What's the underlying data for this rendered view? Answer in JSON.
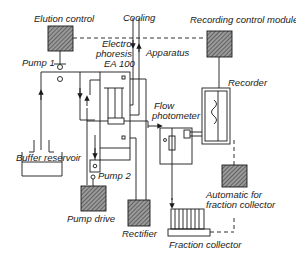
{
  "diagram": {
    "labels": {
      "elution_control": "Elution control",
      "cooling": "Cooling",
      "recording_control_module": "Recording control module",
      "electrophoresis_line1": "Electro",
      "electrophoresis_line2": "phoresis",
      "electrophoresis_line3": "EA 100",
      "apparatus": "Apparatus",
      "pump1": "Pump 1",
      "recorder": "Recorder",
      "flow_line1": "Flow",
      "flow_line2": "photometer",
      "buffer_reservoir": "Buffer reservoir",
      "pump2": "Pump 2",
      "pump_drive": "Pump drive",
      "rectifier": "Rectifier",
      "automatic_line1": "Automatic for",
      "automatic_line2": "fraction collector",
      "fraction_collector": "Fraction collector"
    },
    "colors": {
      "line": "#1a1a1a",
      "hatch": "#555555",
      "background": "#ffffff"
    }
  }
}
